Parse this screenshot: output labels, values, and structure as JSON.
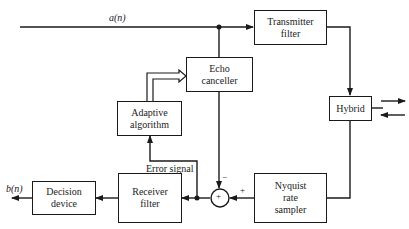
{
  "diagram": {
    "type": "block-diagram",
    "signals": {
      "input": "a(n)",
      "output": "b(n)",
      "error": "Error signal",
      "sum_minus": "−",
      "sum_plus": "+",
      "summer_symbol": "+"
    },
    "blocks": {
      "transmitter_filter": "Transmitter filter",
      "transmitter_filter_l1": "Transmitter",
      "transmitter_filter_l2": "filter",
      "hybrid": "Hybrid",
      "echo_canceller_l1": "Echo",
      "echo_canceller_l2": "canceller",
      "adaptive_algorithm_l1": "Adaptive",
      "adaptive_algorithm_l2": "algorithm",
      "nyquist_l1": "Nyquist",
      "nyquist_l2": "rate",
      "nyquist_l3": "sampler",
      "receiver_filter_l1": "Receiver",
      "receiver_filter_l2": "filter",
      "decision_device_l1": "Decision",
      "decision_device_l2": "device"
    },
    "connections": [
      [
        "a(n)",
        "Transmitter filter"
      ],
      [
        "a(n)",
        "Echo canceller"
      ],
      [
        "Transmitter filter",
        "Hybrid"
      ],
      [
        "Hybrid",
        "Nyquist rate sampler"
      ],
      [
        "Nyquist rate sampler",
        "Summer (+)"
      ],
      [
        "Echo canceller",
        "Summer (−)"
      ],
      [
        "Summer",
        "Receiver filter"
      ],
      [
        "Summer",
        "Adaptive algorithm (Error signal)"
      ],
      [
        "Adaptive algorithm",
        "Echo canceller"
      ],
      [
        "Receiver filter",
        "Decision device"
      ],
      [
        "Decision device",
        "b(n)"
      ]
    ]
  }
}
